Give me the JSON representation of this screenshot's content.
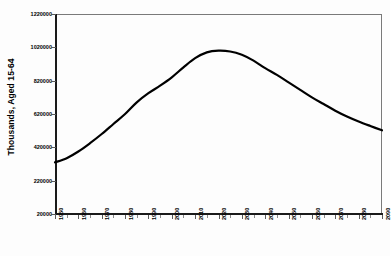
{
  "chart_data": {
    "type": "line",
    "title": "",
    "subtitle": "",
    "xlabel": "",
    "ylabel": "Thousands, Aged 15-64",
    "xlim": [
      1950,
      2090
    ],
    "ylim": [
      20000,
      1220000
    ],
    "grid": false,
    "legend": null,
    "y_ticks": [
      20000,
      220000,
      420000,
      620000,
      820000,
      1020000,
      1220000
    ],
    "y_tick_labels": [
      "20000",
      "220000",
      "420000",
      "620000",
      "820000",
      "1020000",
      "1220000"
    ],
    "x_ticks": [
      1950,
      1960,
      1970,
      1980,
      1990,
      2000,
      2010,
      2020,
      2030,
      2040,
      2050,
      2060,
      2070,
      2080,
      2090
    ],
    "x_tick_labels": [
      "1950",
      "1960",
      "1970",
      "1980",
      "1990",
      "2000",
      "2010",
      "2020",
      "2030",
      "2040",
      "2050",
      "2060",
      "2070",
      "2080",
      "2090"
    ],
    "x_minor_tick_step": 5,
    "series": [
      {
        "name": "Population Aged 15-64",
        "color": "#000000",
        "line_width": 2.2,
        "x": [
          1950,
          1955,
          1960,
          1965,
          1970,
          1975,
          1980,
          1985,
          1990,
          1995,
          2000,
          2005,
          2010,
          2015,
          2020,
          2025,
          2030,
          2035,
          2040,
          2045,
          2050,
          2055,
          2060,
          2065,
          2070,
          2075,
          2080,
          2085,
          2090
        ],
        "values": [
          330000,
          355000,
          395000,
          445000,
          500000,
          560000,
          620000,
          690000,
          745000,
          790000,
          840000,
          900000,
          955000,
          990000,
          1000000,
          995000,
          975000,
          940000,
          895000,
          855000,
          810000,
          765000,
          720000,
          680000,
          640000,
          605000,
          575000,
          548000,
          522000
        ]
      }
    ]
  },
  "frame": {
    "border_color": "#7a7a7a",
    "axis_color": "#1a1a1a",
    "background": "#fdfdfd"
  }
}
